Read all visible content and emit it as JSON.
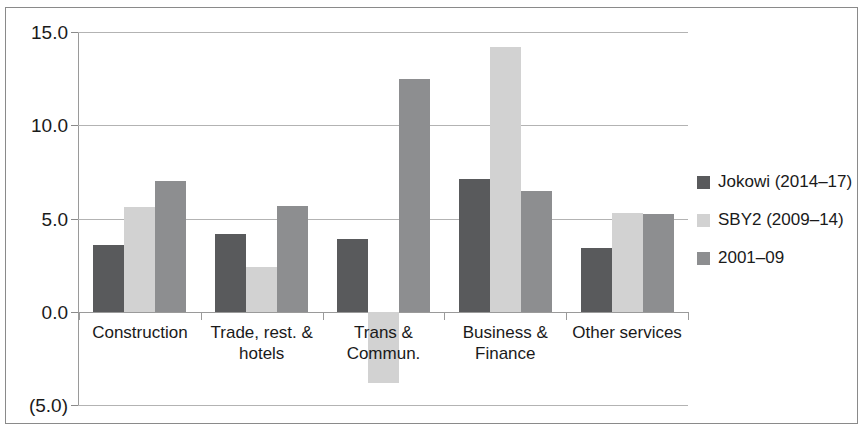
{
  "chart_data": {
    "type": "bar",
    "title": "",
    "subtitle": "",
    "xlabel": "",
    "ylabel": "",
    "grid": true,
    "legend_position": "right",
    "ylim": [
      -5.0,
      15.0
    ],
    "ytick_labels": [
      "15.0",
      "10.0",
      "5.0",
      "0.0",
      "(5.0)"
    ],
    "ytick_values": [
      15.0,
      10.0,
      5.0,
      0.0,
      -5.0
    ],
    "categories": [
      "Construction",
      "Trade, rest. & hotels",
      "Trans & Commun.",
      "Business & Finance",
      "Other services"
    ],
    "series": [
      {
        "name": "Jokowi (2014–17)",
        "color": "#595a5c",
        "values": [
          3.6,
          4.2,
          3.9,
          7.1,
          3.45
        ]
      },
      {
        "name": "SBY2 (2009–14)",
        "color": "#d2d2d2",
        "values": [
          5.6,
          2.4,
          -3.8,
          14.2,
          5.3
        ]
      },
      {
        "name": "2001–09",
        "color": "#8d8e90",
        "values": [
          7.0,
          5.7,
          12.5,
          6.5,
          5.25
        ]
      }
    ]
  },
  "legend": {
    "items": [
      {
        "label": "Jokowi (2014–17)",
        "color": "#595a5c"
      },
      {
        "label": "SBY2 (2009–14)",
        "color": "#d2d2d2"
      },
      {
        "label": "2001–09",
        "color": "#8d8e90"
      }
    ]
  }
}
